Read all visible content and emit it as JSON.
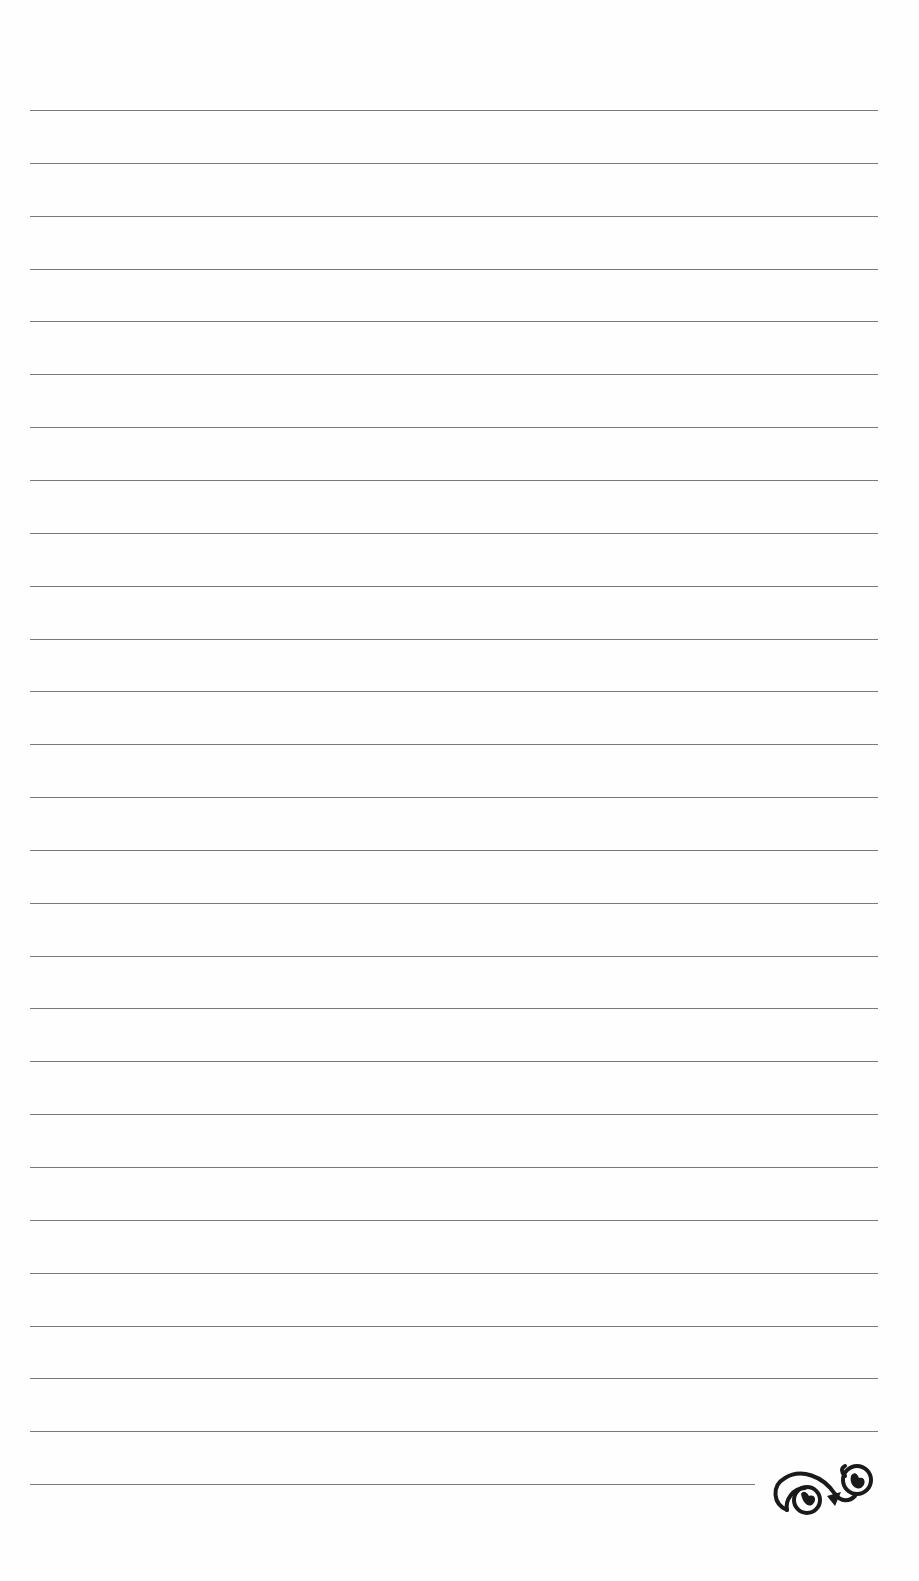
{
  "page": {
    "type": "lined-notepaper",
    "background_color": "#fefefe",
    "rule_color": "#7a7a7a",
    "rule_count": 27,
    "rule_first_y": 110,
    "rule_spacing": 52.85,
    "rule_left": 30,
    "rule_right": 878,
    "last_rule_right": 755
  },
  "ornament": {
    "icon": "flourish-scroll-icon",
    "color": "#1a1a1a"
  }
}
